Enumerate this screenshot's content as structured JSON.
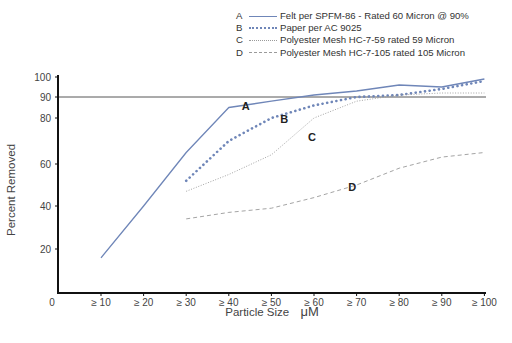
{
  "chart_data": {
    "type": "line",
    "title": "",
    "xlabel": "Particle Size",
    "xlabel_unit": "μM",
    "ylabel": "Percent Removed",
    "x_origin_label": "0",
    "categories": [
      "≥ 10",
      "≥ 20",
      "≥ 30",
      "≥ 40",
      "≥ 50",
      "≥ 60",
      "≥ 70",
      "≥ 80",
      "≥ 90",
      "≥ 100"
    ],
    "y_ticks": [
      20,
      40,
      60,
      80,
      90,
      100
    ],
    "ylim": [
      0,
      100
    ],
    "y_scale": "non-linear (expanded near 100)",
    "reference_line": {
      "y": 90,
      "label": "90"
    },
    "grid": false,
    "legend_position": "top-right",
    "series": [
      {
        "key": "A",
        "name": "Felt per SPFM-86 - Rated 60 Micron @ 90%",
        "style": "solid",
        "color": "#6f86b8",
        "values": [
          16,
          40,
          65,
          85,
          88,
          91,
          93,
          96,
          95,
          99
        ]
      },
      {
        "key": "B",
        "name": "Paper per AC 9025",
        "style": "dotted-heavy",
        "color": "#6f86b8",
        "values": [
          null,
          null,
          52,
          70,
          80,
          86,
          90,
          91,
          94,
          98
        ]
      },
      {
        "key": "C",
        "name": "Polyester Mesh HC-7-59 rated 59 Micron",
        "style": "dotted-fine",
        "color": "#9a9a9a",
        "values": [
          null,
          null,
          47,
          55,
          64,
          80,
          88,
          91,
          92,
          92
        ]
      },
      {
        "key": "D",
        "name": "Polyester Mesh HC-7-105 rated 105 Micron",
        "style": "dashed",
        "color": "#9a9a9a",
        "values": [
          null,
          null,
          34,
          37,
          39,
          44,
          50,
          58,
          63,
          65
        ]
      }
    ],
    "annotations": [
      {
        "text": "A",
        "x_cat": 3.4,
        "y": 84
      },
      {
        "text": "B",
        "x_cat": 4.3,
        "y": 78
      },
      {
        "text": "C",
        "x_cat": 4.95,
        "y": 70
      },
      {
        "text": "D",
        "x_cat": 5.9,
        "y": 47
      }
    ]
  },
  "legend": [
    {
      "key": "A",
      "label": "Felt per SPFM-86 - Rated 60 Micron @ 90%"
    },
    {
      "key": "B",
      "label": "Paper per AC 9025"
    },
    {
      "key": "C",
      "label": "Polyester Mesh HC-7-59 rated 59 Micron"
    },
    {
      "key": "D",
      "label": "Polyester Mesh HC-7-105 rated 105 Micron"
    }
  ]
}
